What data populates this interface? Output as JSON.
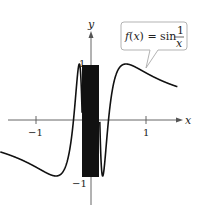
{
  "chart_data": {
    "type": "line",
    "title": "",
    "function": "sin(1/x)",
    "xlabel": "x",
    "ylabel": "y",
    "xlim": [
      -1.65,
      1.95
    ],
    "ylim": [
      -1.75,
      1.55
    ],
    "x_ticks": [
      {
        "value": -1,
        "label": "−1"
      },
      {
        "value": 1,
        "label": "1"
      }
    ],
    "y_ticks": [
      {
        "value": 1,
        "label": "1"
      },
      {
        "value": -1,
        "label": "−1"
      }
    ],
    "grid": false,
    "annotation": {
      "lhs": "f(x) = sin",
      "frac_num": "1",
      "frac_den": "x",
      "points_to_x": 0.9
    },
    "series": [
      {
        "name": "f(x) = sin(1/x)",
        "x_range": [
          -1.65,
          1.57
        ],
        "sample_points": [
          [
            -1.6,
            -0.57
          ],
          [
            -1.0,
            -0.84
          ],
          [
            -0.64,
            -1.0
          ],
          [
            -0.4,
            -0.6
          ],
          [
            -0.32,
            0.0
          ],
          [
            -0.21,
            1.0
          ],
          [
            -0.16,
            0.0
          ],
          [
            0.16,
            0.0
          ],
          [
            0.21,
            -1.0
          ],
          [
            0.32,
            0.0
          ],
          [
            0.64,
            1.0
          ],
          [
            1.0,
            0.84
          ],
          [
            1.5,
            0.62
          ]
        ]
      }
    ]
  },
  "axes": {
    "x_label": "x",
    "y_label": "y"
  }
}
